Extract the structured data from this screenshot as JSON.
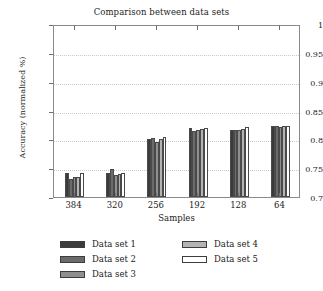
{
  "chart_data": {
    "type": "bar",
    "title": "Comparison between data sets",
    "xlabel": "Samples",
    "ylabel": "Accuracy (normalized %)",
    "categories": [
      "384",
      "320",
      "256",
      "192",
      "128",
      "64"
    ],
    "ylim": [
      0.7,
      1
    ],
    "yticks": [
      "0.7",
      "0.75",
      "0.8",
      "0.85",
      "0.9",
      "0.95",
      "1"
    ],
    "ytick_values": [
      0.7,
      0.75,
      0.8,
      0.85,
      0.9,
      0.95,
      1
    ],
    "grid": true,
    "legend_position": "below-axes",
    "series": [
      {
        "name": "Data set 1",
        "color": "#3b3b3b",
        "values": [
          0.742,
          0.741,
          0.801,
          0.82,
          0.816,
          0.823
        ]
      },
      {
        "name": "Data set 2",
        "color": "#6b6b6b",
        "values": [
          0.732,
          0.749,
          0.802,
          0.814,
          0.816,
          0.824
        ]
      },
      {
        "name": "Data set 3",
        "color": "#8f8f8f",
        "values": [
          0.734,
          0.739,
          0.796,
          0.817,
          0.816,
          0.822
        ]
      },
      {
        "name": "Data set 4",
        "color": "#b4b4b4",
        "values": [
          0.735,
          0.74,
          0.8,
          0.818,
          0.818,
          0.824
        ]
      },
      {
        "name": "Data set 5",
        "color": "#ffffff",
        "values": [
          0.742,
          0.742,
          0.804,
          0.819,
          0.821,
          0.823
        ]
      }
    ]
  },
  "legend": {
    "column1": [
      "Data set 1",
      "Data set 2",
      "Data set 3"
    ],
    "column2": [
      "Data set 4",
      "Data set 5"
    ]
  }
}
